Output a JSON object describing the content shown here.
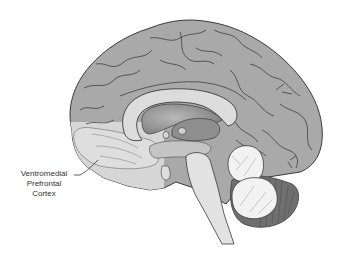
{
  "figure": {
    "annotations": [
      {
        "id": "vmpfc",
        "lines": [
          "Ventromedial",
          "Prefrontal",
          "Cortex"
        ],
        "target": "ventromedial-prefrontal-cortex"
      }
    ]
  },
  "colors": {
    "cortex": "#a9a9a9",
    "highlight_region": "#d6d6d6",
    "corpus_callosum": "#dcdcdc",
    "ventricle": "#8e8e8e",
    "cerebellum": "#f2f2f2",
    "cerebellum_outer": "#6f6f6f",
    "brainstem": "#e2e2e2",
    "outline": "#3a3a3a",
    "label_text": "#333333"
  }
}
